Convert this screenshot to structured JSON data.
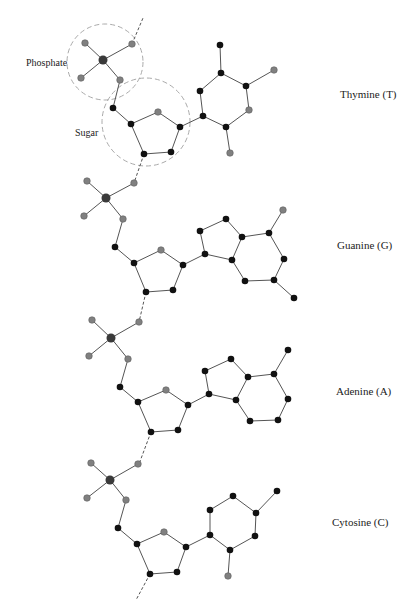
{
  "diagram": {
    "annotations": {
      "phosphate": "Phosphate",
      "sugar": "Sugar"
    },
    "colors": {
      "bond": "#555555",
      "carbon_nitrogen_atom": "#111111",
      "oxygen_atom": "#808080",
      "phosphorus_atom": "#3a3a3a",
      "dashed_circle": "#aaaaaa",
      "text": "#222222"
    },
    "nucleotides": [
      {
        "base": "Thymine (T)",
        "label_pos": [
          340,
          95
        ]
      },
      {
        "base": "Guanine (G)",
        "label_pos": [
          337,
          246
        ]
      },
      {
        "base": "Adenine (A)",
        "label_pos": [
          336,
          392
        ]
      },
      {
        "base": "Cytosine (C)",
        "label_pos": [
          332,
          523
        ]
      }
    ]
  }
}
